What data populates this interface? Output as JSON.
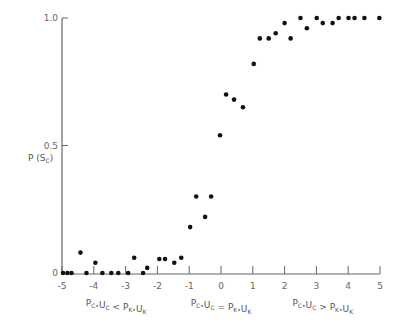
{
  "chart_data": {
    "type": "scatter",
    "title": "",
    "ylabel": "P (S_C)",
    "xlabel": "",
    "xlim": [
      -5,
      5
    ],
    "ylim": [
      0,
      1.0
    ],
    "x_ticks": [
      -5,
      -4,
      -3,
      -2,
      -1,
      0,
      1,
      2,
      3,
      4,
      5
    ],
    "y_ticks": [
      0,
      0.5,
      1.0
    ],
    "y_tick_labels": [
      "0",
      "0.5",
      "1.0"
    ],
    "grid": false,
    "legend": null,
    "annotations": [
      {
        "text": "P_C*U_C < P_K*U_K",
        "x": -3.3
      },
      {
        "text": "P_C*U_C = P_K*U_K",
        "x": 0
      },
      {
        "text": "P_C*U_C > P_K*U_K",
        "x": 3.2
      }
    ],
    "series": [
      {
        "name": "observed",
        "points": [
          [
            -4.97,
            0.0
          ],
          [
            -4.83,
            0.0
          ],
          [
            -4.7,
            0.0
          ],
          [
            -4.42,
            0.08
          ],
          [
            -4.23,
            0.0
          ],
          [
            -3.95,
            0.04
          ],
          [
            -3.73,
            0.0
          ],
          [
            -3.45,
            0.0
          ],
          [
            -3.23,
            0.0
          ],
          [
            -2.92,
            0.0
          ],
          [
            -2.73,
            0.06
          ],
          [
            -2.45,
            0.0
          ],
          [
            -2.32,
            0.02
          ],
          [
            -1.94,
            0.055
          ],
          [
            -1.76,
            0.055
          ],
          [
            -1.47,
            0.04
          ],
          [
            -1.25,
            0.06
          ],
          [
            -0.97,
            0.18
          ],
          [
            -0.78,
            0.3
          ],
          [
            -0.5,
            0.22
          ],
          [
            -0.31,
            0.3
          ],
          [
            -0.03,
            0.54
          ],
          [
            0.16,
            0.7
          ],
          [
            0.41,
            0.68
          ],
          [
            0.69,
            0.65
          ],
          [
            1.03,
            0.82
          ],
          [
            1.22,
            0.92
          ],
          [
            1.5,
            0.92
          ],
          [
            1.72,
            0.94
          ],
          [
            2.0,
            0.98
          ],
          [
            2.19,
            0.92
          ],
          [
            2.5,
            1.0
          ],
          [
            2.7,
            0.96
          ],
          [
            3.01,
            1.0
          ],
          [
            3.2,
            0.98
          ],
          [
            3.51,
            0.98
          ],
          [
            3.7,
            1.0
          ],
          [
            4.01,
            1.0
          ],
          [
            4.2,
            1.0
          ],
          [
            4.51,
            1.0
          ],
          [
            4.98,
            1.0
          ]
        ]
      }
    ]
  }
}
